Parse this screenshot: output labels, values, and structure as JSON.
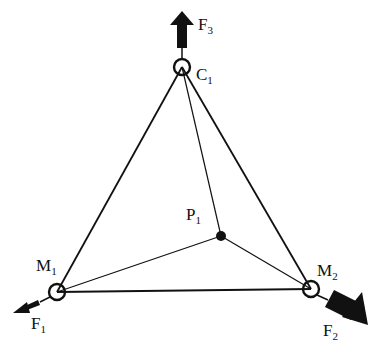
{
  "diagram": {
    "type": "force-diagram",
    "nodes": {
      "C1": {
        "label": "C",
        "sub": "1",
        "x": 182,
        "y": 67
      },
      "M1": {
        "label": "M",
        "sub": "1",
        "x": 57,
        "y": 292
      },
      "M2": {
        "label": "M",
        "sub": "2",
        "x": 311,
        "y": 289
      },
      "P1": {
        "label": "P",
        "sub": "1",
        "x": 221,
        "y": 236
      }
    },
    "forces": {
      "F1": {
        "label": "F",
        "sub": "1",
        "applied_at": "M1",
        "direction": "down-left"
      },
      "F2": {
        "label": "F",
        "sub": "2",
        "applied_at": "M2",
        "direction": "down-right"
      },
      "F3": {
        "label": "F",
        "sub": "3",
        "applied_at": "C1",
        "direction": "up"
      }
    },
    "edges": [
      [
        "C1",
        "M1"
      ],
      [
        "C1",
        "M2"
      ],
      [
        "M1",
        "M2"
      ],
      [
        "C1",
        "P1"
      ],
      [
        "M1",
        "P1"
      ],
      [
        "M2",
        "P1"
      ]
    ]
  }
}
